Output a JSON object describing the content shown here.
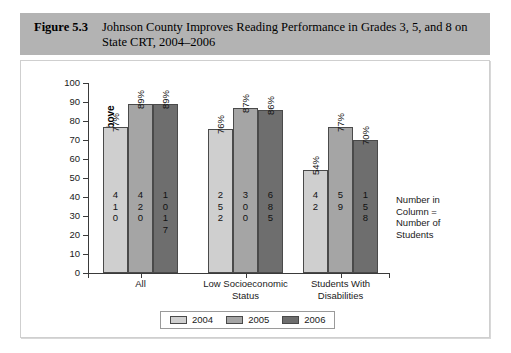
{
  "caption": {
    "figure_number": "Figure 5.3",
    "title": "Johnson County Improves Reading Performance in Grades 3, 5, and 8 on State CRT, 2004–2006"
  },
  "annotation": {
    "line1": "Number in",
    "line2": "Column =",
    "line3": "Number of",
    "line4": "Students"
  },
  "legend": {
    "items": [
      {
        "label": "2004",
        "color": "#cfcfcf"
      },
      {
        "label": "2005",
        "color": "#a5a5a5"
      },
      {
        "label": "2006",
        "color": "#6e6e6e"
      }
    ]
  },
  "chart_data": {
    "type": "bar",
    "title": "Johnson County Improves Reading Performance in Grades 3, 5, and 8 on State CRT, 2004–2006",
    "xlabel": "",
    "ylabel": "Percentage Proficient and Above",
    "ylim": [
      0,
      100
    ],
    "ytick_labels": [
      "0",
      "10",
      "20",
      "30",
      "40",
      "50",
      "60",
      "70",
      "80",
      "90",
      "100"
    ],
    "grid": false,
    "legend_position": "bottom",
    "categories": [
      "All",
      "Low Socioeconomic Status",
      "Students With Disabilities"
    ],
    "category_lines": [
      [
        "All"
      ],
      [
        "Low Socioeconomic",
        "Status"
      ],
      [
        "Students With",
        "Disabilities"
      ]
    ],
    "series": [
      {
        "name": "2004",
        "color": "#cfcfcf",
        "values": [
          77,
          76,
          54
        ],
        "value_labels": [
          "77%",
          "76%",
          "54%"
        ],
        "counts": [
          410,
          252,
          42
        ],
        "count_digits": [
          [
            "4",
            "1",
            "0"
          ],
          [
            "2",
            "5",
            "2"
          ],
          [
            "4",
            "2"
          ]
        ]
      },
      {
        "name": "2005",
        "color": "#a5a5a5",
        "values": [
          89,
          87,
          77
        ],
        "value_labels": [
          "89%",
          "87%",
          "77%"
        ],
        "counts": [
          420,
          300,
          59
        ],
        "count_digits": [
          [
            "4",
            "2",
            "0"
          ],
          [
            "3",
            "0",
            "0"
          ],
          [
            "5",
            "9"
          ]
        ]
      },
      {
        "name": "2006",
        "color": "#6e6e6e",
        "values": [
          89,
          86,
          70
        ],
        "value_labels": [
          "89%",
          "86%",
          "70%"
        ],
        "counts": [
          1017,
          685,
          158
        ],
        "count_digits": [
          [
            "1",
            "0",
            "1",
            "7"
          ],
          [
            "6",
            "8",
            "5"
          ],
          [
            "1",
            "5",
            "8"
          ]
        ]
      }
    ]
  }
}
